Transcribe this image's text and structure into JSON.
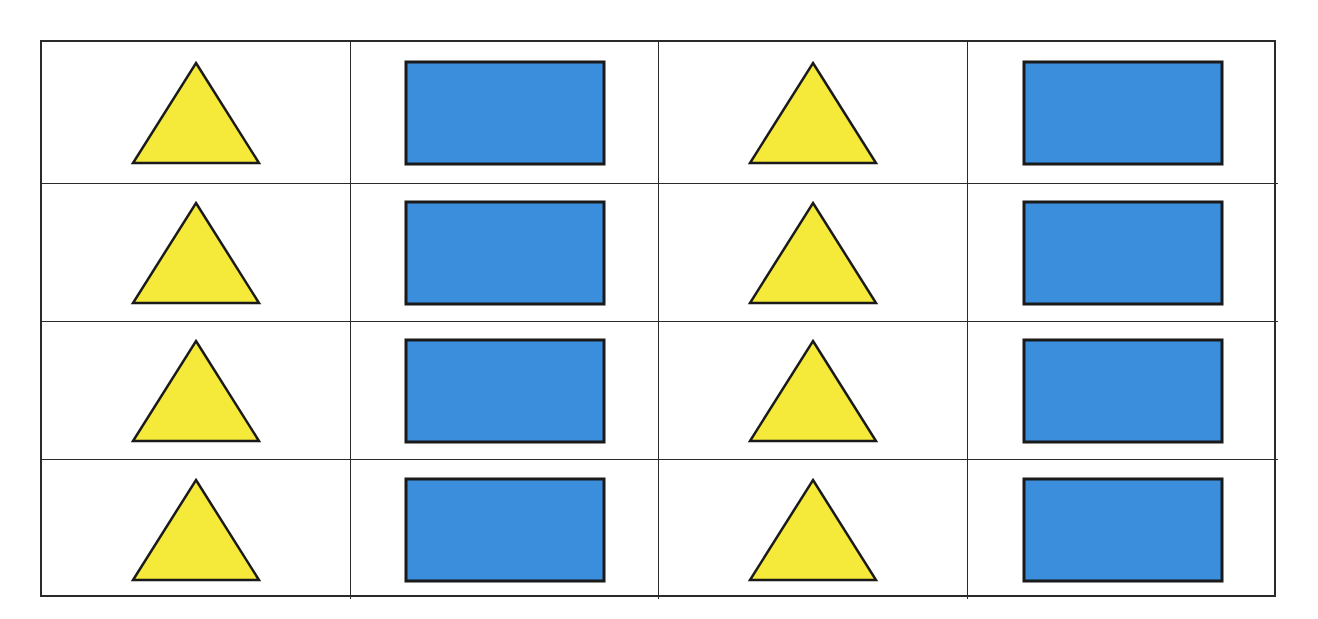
{
  "diagram": {
    "rows": 4,
    "columns": 4,
    "colors": {
      "triangle_fill": "#F5E93A",
      "rectangle_fill": "#3A8EDC",
      "outline": "#1a1a1a",
      "grid_line": "#2a2a2a"
    },
    "cells": [
      [
        "triangle",
        "rectangle",
        "triangle",
        "rectangle"
      ],
      [
        "triangle",
        "rectangle",
        "triangle",
        "rectangle"
      ],
      [
        "triangle",
        "rectangle",
        "triangle",
        "rectangle"
      ],
      [
        "triangle",
        "rectangle",
        "triangle",
        "rectangle"
      ]
    ]
  }
}
